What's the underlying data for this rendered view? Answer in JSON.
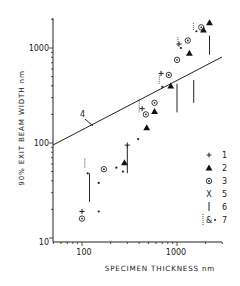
{
  "chart_data": {
    "type": "scatter",
    "title": "",
    "xlabel": "SPECIMEN THICKNESS nm",
    "ylabel": "90% EXIT BEAM WIDTH nm",
    "xscale": "log",
    "yscale": "log",
    "xlim": [
      50,
      3000
    ],
    "ylim": [
      10,
      2000
    ],
    "x_ticks": [
      100,
      1000
    ],
    "y_ticks": [
      10,
      100,
      1000
    ],
    "grid": false,
    "legend_position": "right, inside",
    "line": {
      "label": "4",
      "points": [
        [
          50,
          100
        ],
        [
          3000,
          850
        ]
      ]
    },
    "series": [
      {
        "name": "1",
        "marker": "plus",
        "points": [
          [
            100,
            19
          ],
          [
            300,
            95
          ],
          [
            430,
            230
          ],
          [
            680,
            540
          ],
          [
            1050,
            1100
          ]
        ]
      },
      {
        "name": "2",
        "marker": "filled-triangle",
        "points": [
          [
            280,
            62
          ],
          [
            480,
            145
          ],
          [
            580,
            215
          ],
          [
            860,
            400
          ],
          [
            1350,
            880
          ],
          [
            1900,
            1550
          ],
          [
            2200,
            1850
          ]
        ]
      },
      {
        "name": "3",
        "marker": "circled-dot",
        "points": [
          [
            100,
            16
          ],
          [
            170,
            53
          ],
          [
            470,
            200
          ],
          [
            580,
            265
          ],
          [
            820,
            520
          ],
          [
            1000,
            750
          ],
          [
            1300,
            1200
          ],
          [
            1800,
            1650
          ]
        ]
      },
      {
        "name": "5",
        "marker": "x",
        "points": []
      },
      {
        "name": "6",
        "marker": "vertical-bar",
        "points": [
          [
            120,
            [
              24,
              48
            ]
          ],
          [
            300,
            [
              48,
              95
            ]
          ],
          [
            1000,
            [
              210,
              420
            ]
          ],
          [
            1500,
            [
              265,
              460
            ]
          ],
          [
            2200,
            [
              850,
              1350
            ]
          ]
        ]
      },
      {
        "name": "7",
        "marker": "dotted-bar-and-dot",
        "points": [
          [
            115,
            48
          ],
          [
            150,
            38
          ],
          [
            150,
            19
          ],
          [
            230,
            55
          ],
          [
            270,
            50
          ],
          [
            390,
            110
          ],
          [
            700,
            390
          ],
          [
            1100,
            1000
          ],
          [
            1600,
            1500
          ]
        ]
      }
    ]
  },
  "labels": {
    "ylabel": "90% EXIT BEAM WIDTH nm",
    "xlabel": "SPECIMEN THICKNESS nm",
    "line_label": "4",
    "ytick_1000": "1000",
    "ytick_100": "100",
    "ytick_10": "10",
    "xtick_100": "100",
    "xtick_1000": "1000"
  },
  "legend": [
    {
      "key": "1",
      "symbol": "plus"
    },
    {
      "key": "2",
      "symbol": "filled-triangle"
    },
    {
      "key": "3",
      "symbol": "circled-dot"
    },
    {
      "key": "5",
      "symbol": "X"
    },
    {
      "key": "6",
      "symbol": "vertical-bar"
    },
    {
      "key": "7",
      "symbol": "dotted-bar-and-dot"
    }
  ]
}
